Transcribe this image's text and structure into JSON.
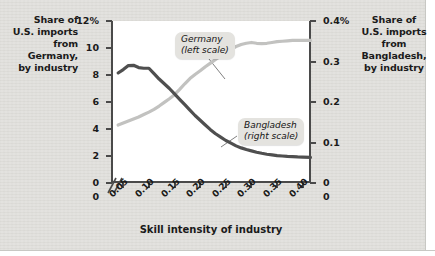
{
  "figure": {
    "background_color": "#dddcd8",
    "plot_background_color": "#ffffff",
    "axis_color": "#4a4a4a"
  },
  "captions": {
    "left": "Share of\nU.S. imports\nfrom\nGermany,\nby industry",
    "right": "Share of\nU.S. imports\nfrom\nBangladesh,\nby industry"
  },
  "callouts": {
    "germany": "Germany\n(left scale)",
    "bangladesh": "Bangladesh\n(right scale)"
  },
  "axes": {
    "x_title": "Skill intensity of industry",
    "x_ticks": [
      "0.05",
      "0.10",
      "0.15",
      "0.20",
      "0.25",
      "0.30",
      "0.35",
      "0.40"
    ],
    "x_origin_label": "0",
    "y_left_ticks": [
      "12%",
      "10",
      "8",
      "6",
      "4",
      "2",
      "0"
    ],
    "y_right_ticks": [
      "0.4%",
      "0.3",
      "0.2",
      "0.1",
      "0"
    ],
    "break_marker": "//"
  },
  "chart_data": {
    "type": "line",
    "title": "",
    "subtitle": "",
    "xlabel": "Skill intensity of industry",
    "ylabel": "Share of U.S. imports from Germany, by industry",
    "ylabel_right": "Share of U.S. imports from Bangladesh, by industry",
    "xlim": [
      0.03,
      0.42
    ],
    "ylim": [
      0,
      12
    ],
    "ylim_right": [
      0,
      0.4
    ],
    "grid": false,
    "legend": "inline-callouts",
    "x": [
      0.04,
      0.05,
      0.06,
      0.07,
      0.08,
      0.09,
      0.1,
      0.11,
      0.12,
      0.13,
      0.14,
      0.15,
      0.16,
      0.17,
      0.18,
      0.19,
      0.2,
      0.21,
      0.22,
      0.23,
      0.24,
      0.25,
      0.26,
      0.27,
      0.28,
      0.29,
      0.3,
      0.31,
      0.32,
      0.33,
      0.34,
      0.35,
      0.36,
      0.37,
      0.38,
      0.39,
      0.4,
      0.415
    ],
    "series": [
      {
        "name": "Germany (left scale)",
        "axis": "left",
        "color": "#4f4f4f",
        "units": "percent",
        "values": [
          8.15,
          8.4,
          8.7,
          8.72,
          8.55,
          8.5,
          8.5,
          8.1,
          7.7,
          7.35,
          7.0,
          6.6,
          6.2,
          5.8,
          5.4,
          5.0,
          4.65,
          4.3,
          3.95,
          3.65,
          3.4,
          3.15,
          2.95,
          2.75,
          2.6,
          2.48,
          2.38,
          2.28,
          2.2,
          2.13,
          2.08,
          2.03,
          2.0,
          1.97,
          1.95,
          1.93,
          1.92,
          1.9
        ]
      },
      {
        "name": "Bangladesh (right scale)",
        "axis": "right",
        "color": "#c2c2c0",
        "units": "percent",
        "values": [
          0.143,
          0.148,
          0.153,
          0.158,
          0.163,
          0.169,
          0.175,
          0.182,
          0.19,
          0.199,
          0.208,
          0.218,
          0.231,
          0.245,
          0.258,
          0.268,
          0.277,
          0.287,
          0.296,
          0.305,
          0.314,
          0.323,
          0.33,
          0.337,
          0.342,
          0.345,
          0.347,
          0.345,
          0.344,
          0.345,
          0.347,
          0.349,
          0.35,
          0.351,
          0.352,
          0.352,
          0.352,
          0.352
        ]
      }
    ]
  }
}
